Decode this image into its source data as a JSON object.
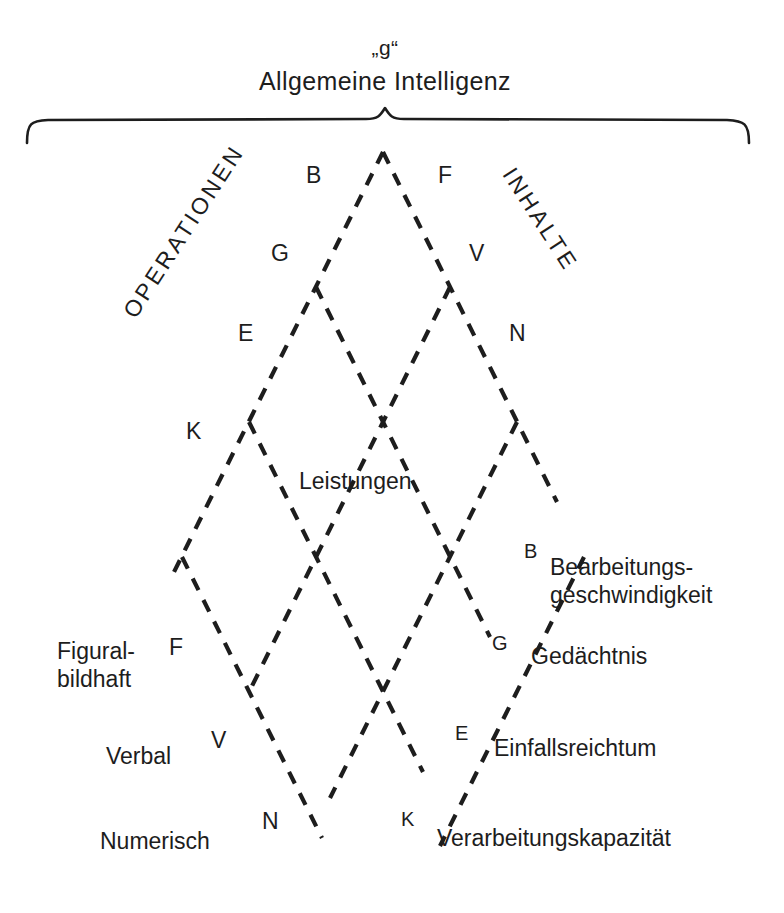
{
  "figure": {
    "title_quoted": "„g“",
    "title_full": "Allgemeine Intelligenz",
    "center_label": "Leistungen",
    "axis_left_caption": "OPERATIONEN",
    "axis_right_caption": "INHALTE",
    "brace": "top-curly-brace",
    "line_style": "dashed",
    "line_color": "#1d1d1d"
  },
  "operations": {
    "letters": [
      "B",
      "G",
      "E",
      "K"
    ],
    "terms": [
      {
        "letter": "B",
        "label_line1": "Bearbeitungs-",
        "label_line2": "geschwindigkeit"
      },
      {
        "letter": "G",
        "label_line1": "Gedächtnis",
        "label_line2": ""
      },
      {
        "letter": "E",
        "label_line1": "Einfallsreichtum",
        "label_line2": ""
      },
      {
        "letter": "K",
        "label_line1": "Verarbeitungskapazität",
        "label_line2": ""
      }
    ]
  },
  "contents": {
    "letters": [
      "F",
      "V",
      "N"
    ],
    "terms": [
      {
        "letter": "F",
        "label_line1": "Figural-",
        "label_line2": "bildhaft"
      },
      {
        "letter": "V",
        "label_line1": "Verbal",
        "label_line2": ""
      },
      {
        "letter": "N",
        "label_line1": "Numerisch",
        "label_line2": ""
      }
    ]
  },
  "left_letters": {
    "b": "B",
    "g": "G",
    "e": "E",
    "k": "K",
    "f": "F",
    "v": "V",
    "n": "N"
  },
  "right_letters": {
    "f": "F",
    "v": "V",
    "n": "N",
    "b": "B",
    "g": "G",
    "e": "E",
    "k": "K"
  },
  "right_terms": {
    "bearbeitungs_1": "Bearbeitungs-",
    "bearbeitungs_2": "geschwindigkeit",
    "gedaechtnis": "Gedächtnis",
    "einfallsreichtum": "Einfallsreichtum",
    "verarbeitungskapazitaet": "Verarbeitungskapazität"
  },
  "left_terms": {
    "figural_1": "Figural-",
    "figural_2": "bildhaft",
    "verbal": "Verbal",
    "numerisch": "Numerisch"
  }
}
